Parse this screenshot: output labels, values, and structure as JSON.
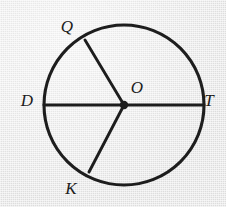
{
  "figure": {
    "width": 226,
    "height": 207,
    "background_color": "#e9e9e9",
    "stroke_color": "#1c1c1c",
    "label_color": "#1c1c1c"
  },
  "chart_data": {
    "type": "diagram",
    "shape": "circle",
    "center": {
      "name": "O",
      "x": 124,
      "y": 105
    },
    "radius": 80,
    "points": [
      {
        "name": "Q",
        "x": 85,
        "y": 40,
        "angle_deg": 121,
        "label_x": 67,
        "label_y": 26
      },
      {
        "name": "D",
        "x": 44,
        "y": 105,
        "angle_deg": 180,
        "label_x": 27,
        "label_y": 100
      },
      {
        "name": "T",
        "x": 204,
        "y": 105,
        "angle_deg": 0,
        "label_x": 209,
        "label_y": 100
      },
      {
        "name": "K",
        "x": 89,
        "y": 172,
        "angle_deg": 241,
        "label_x": 71,
        "label_y": 188
      },
      {
        "name": "O",
        "x": 124,
        "y": 105,
        "angle_deg": null,
        "label_x": 137,
        "label_y": 87
      }
    ],
    "segments": [
      {
        "name": "diameter-DT",
        "from": "D",
        "to": "T",
        "kind": "diameter",
        "x1": 44,
        "y1": 105,
        "x2": 204,
        "y2": 105
      },
      {
        "name": "radius-OQ",
        "from": "O",
        "to": "Q",
        "kind": "radius",
        "x1": 124,
        "y1": 105,
        "x2": 85,
        "y2": 40
      },
      {
        "name": "radius-OK",
        "from": "O",
        "to": "K",
        "kind": "radius",
        "x1": 124,
        "y1": 105,
        "x2": 89,
        "y2": 172
      }
    ]
  },
  "labels": {
    "Q": "Q",
    "D": "D",
    "O": "O",
    "T": "T",
    "K": "K"
  }
}
